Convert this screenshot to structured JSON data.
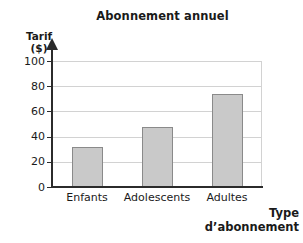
{
  "chart_data": {
    "type": "bar",
    "title": "Abonnement annuel",
    "xlabel_line1": "Type",
    "xlabel_line2": "d’abonnement",
    "ylabel": "Tarif",
    "yunit": "($)",
    "categories": [
      "Enfants",
      "Adolescents",
      "Adultes"
    ],
    "values": [
      32,
      48,
      74
    ],
    "ylim": [
      0,
      100
    ],
    "yticks": [
      100,
      80,
      60,
      40,
      20,
      0
    ],
    "ytick_labels": [
      "100",
      "80",
      "60",
      "40",
      "20",
      "0"
    ],
    "grid": true,
    "legend": "none",
    "bar_fill": "#c9c9c9",
    "bar_border": "#8a8a8a",
    "axis_color": "#2b2b2b",
    "grid_color": "#d2d2d2"
  }
}
